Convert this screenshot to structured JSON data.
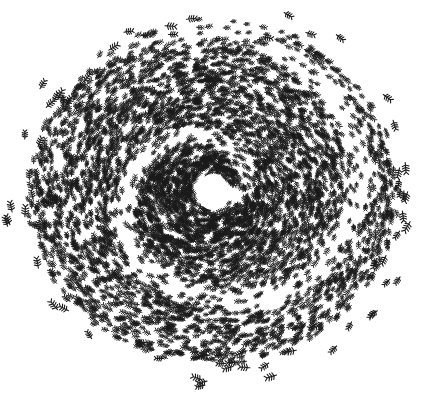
{
  "image": {
    "subject": "ant mill illustration",
    "description": "Dense circular vortex of black ants drawn in ink on white background, spiraling around a small empty white center",
    "background_color": "#ffffff",
    "ink_color": "#1a1a1a",
    "center": [
      213,
      192
    ],
    "hole_radius": 16,
    "outer_radius": 190
  }
}
